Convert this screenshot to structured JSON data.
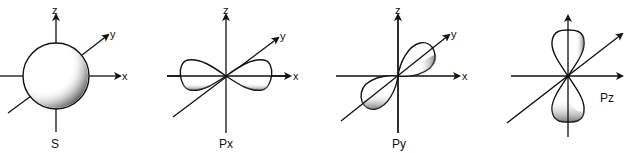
{
  "orbitals": [
    {
      "name": "S",
      "axes": {
        "x": "x",
        "y": "y",
        "z": "z"
      }
    },
    {
      "name": "Px",
      "axes": {
        "x": "x",
        "y": "y",
        "z": "z"
      }
    },
    {
      "name": "Py",
      "axes": {
        "x": "x",
        "y": "y",
        "z": "z"
      }
    },
    {
      "name": "Pz",
      "axes": {
        "x": "",
        "y": "",
        "z": ""
      }
    }
  ]
}
